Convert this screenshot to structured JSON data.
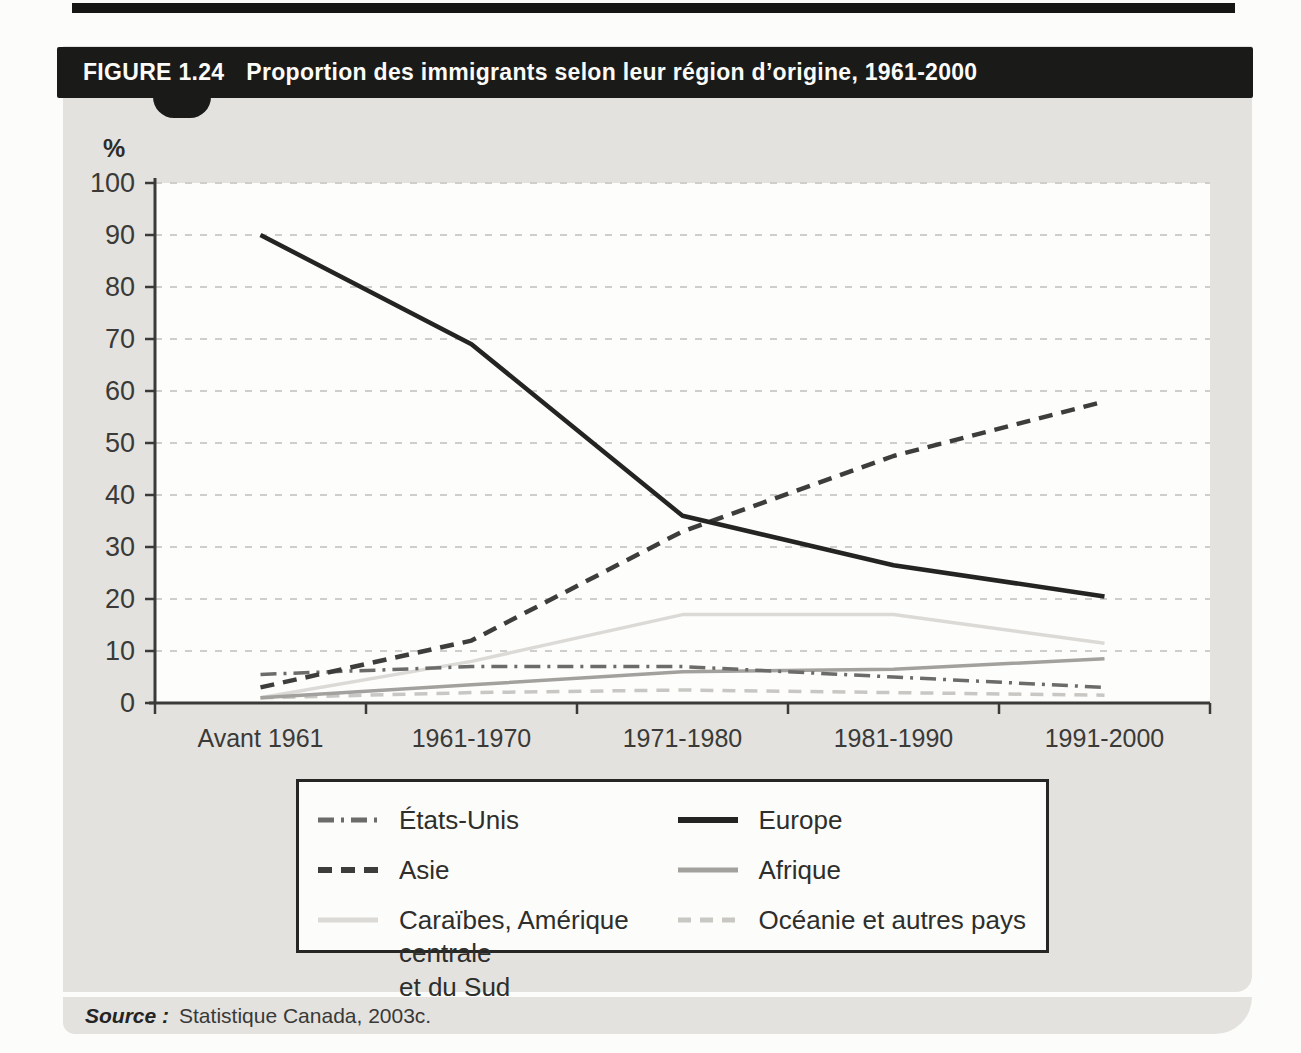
{
  "figure": {
    "label": "FIGURE 1.24",
    "title": "Proportion des immigrants selon leur région d’origine, 1961-2000",
    "header_color": "#1a1a18",
    "panel_color": "#e3e2df"
  },
  "axis": {
    "unit_label": "%"
  },
  "source": {
    "label": "Source :",
    "text": "Statistique Canada, 2003c."
  },
  "legend": {
    "order": [
      "etats-unis",
      "europe",
      "asie",
      "afrique",
      "caraibes",
      "oceanie"
    ]
  },
  "chart_data": {
    "type": "line",
    "title": "Proportion des immigrants selon leur région d’origine, 1961-2000",
    "xlabel": "",
    "ylabel": "%",
    "ylim": [
      0,
      100
    ],
    "ytick_step": 10,
    "grid": "horizontal-dashed",
    "legend_position": "below",
    "categories": [
      "Avant 1961",
      "1961-1970",
      "1971-1980",
      "1981-1990",
      "1991-2000"
    ],
    "series": [
      {
        "key": "caraibes",
        "name": "Caraïbes, Amérique centrale\net du Sud",
        "values": [
          1,
          8,
          17,
          17,
          11.5
        ],
        "color": "#dbdad6",
        "dash": "",
        "width": 3.5
      },
      {
        "key": "oceanie",
        "name": "Océanie et autres pays",
        "values": [
          1,
          2,
          2.5,
          2,
          1.5
        ],
        "color": "#c8c7c3",
        "dash": "13 9",
        "width": 3.5
      },
      {
        "key": "afrique",
        "name": "Afrique",
        "values": [
          1,
          3.5,
          6,
          6.5,
          8.5
        ],
        "color": "#a2a19e",
        "dash": "",
        "width": 3.5
      },
      {
        "key": "etats-unis",
        "name": "États-Unis",
        "values": [
          5.5,
          7,
          7,
          5,
          3
        ],
        "color": "#6b6b69",
        "dash": "16 7 3 7",
        "width": 3.5
      },
      {
        "key": "asie",
        "name": "Asie",
        "values": [
          3,
          12,
          33,
          47.5,
          58
        ],
        "color": "#3d3d3b",
        "dash": "14 9",
        "width": 4.5
      },
      {
        "key": "europe",
        "name": "Europe",
        "values": [
          90,
          69,
          36,
          26.5,
          20.5
        ],
        "color": "#242422",
        "dash": "",
        "width": 4.5
      }
    ],
    "colors": {
      "grid": "#cfcecb",
      "axis": "#3a3a38",
      "plot_background": "#fdfdfc",
      "tick_text": "#3a3a38"
    }
  }
}
